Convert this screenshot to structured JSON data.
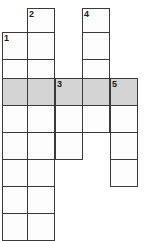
{
  "puzzle": {
    "type": "crossword-grid",
    "columns": 5,
    "rows": 9,
    "cell_size": 27,
    "colors": {
      "cell_fill": "#fdfdfd",
      "shaded_fill": "#d4d4d4",
      "grid_line": "#3a3a3a",
      "number_text": "#1a1a1a",
      "page_background": "#ffffff"
    },
    "clue_numbers": [
      "1",
      "2",
      "3",
      "4",
      "5"
    ],
    "shaded_row_index": 3,
    "cells": [
      {
        "name": "cell-c2-r0",
        "col": 1,
        "row": 0,
        "x": 27,
        "y": 8,
        "w": 28,
        "h": 25,
        "shaded": false,
        "number": "2"
      },
      {
        "name": "cell-c4-r0",
        "col": 3,
        "row": 0,
        "x": 82,
        "y": 8,
        "w": 28,
        "h": 25,
        "shaded": false,
        "number": "4"
      },
      {
        "name": "cell-c1-r1",
        "col": 0,
        "row": 1,
        "x": 2,
        "y": 32,
        "w": 26,
        "h": 28,
        "shaded": false,
        "number": "1"
      },
      {
        "name": "cell-c2-r1",
        "col": 1,
        "row": 1,
        "x": 27,
        "y": 32,
        "w": 28,
        "h": 28,
        "shaded": false,
        "number": ""
      },
      {
        "name": "cell-c4-r1",
        "col": 3,
        "row": 1,
        "x": 82,
        "y": 32,
        "w": 28,
        "h": 28,
        "shaded": false,
        "number": ""
      },
      {
        "name": "cell-c1-r2",
        "col": 0,
        "row": 2,
        "x": 2,
        "y": 59,
        "w": 26,
        "h": 20,
        "shaded": false,
        "number": ""
      },
      {
        "name": "cell-c2-r2",
        "col": 1,
        "row": 2,
        "x": 27,
        "y": 59,
        "w": 28,
        "h": 20,
        "shaded": false,
        "number": ""
      },
      {
        "name": "cell-c4-r2",
        "col": 3,
        "row": 2,
        "x": 82,
        "y": 59,
        "w": 28,
        "h": 20,
        "shaded": false,
        "number": ""
      },
      {
        "name": "cell-c1-r3",
        "col": 0,
        "row": 3,
        "x": 2,
        "y": 78,
        "w": 26,
        "h": 28,
        "shaded": true,
        "number": ""
      },
      {
        "name": "cell-c2-r3",
        "col": 1,
        "row": 3,
        "x": 27,
        "y": 78,
        "w": 28,
        "h": 28,
        "shaded": true,
        "number": ""
      },
      {
        "name": "cell-c3-r3",
        "col": 2,
        "row": 3,
        "x": 55,
        "y": 78,
        "w": 28,
        "h": 28,
        "shaded": true,
        "number": "3"
      },
      {
        "name": "cell-c4-r3",
        "col": 3,
        "row": 3,
        "x": 82,
        "y": 78,
        "w": 28,
        "h": 28,
        "shaded": true,
        "number": ""
      },
      {
        "name": "cell-c5-r3",
        "col": 4,
        "row": 3,
        "x": 110,
        "y": 78,
        "w": 28,
        "h": 28,
        "shaded": true,
        "number": "5"
      },
      {
        "name": "cell-c1-r4",
        "col": 0,
        "row": 4,
        "x": 2,
        "y": 105,
        "w": 26,
        "h": 28,
        "shaded": false,
        "number": ""
      },
      {
        "name": "cell-c2-r4",
        "col": 1,
        "row": 4,
        "x": 27,
        "y": 105,
        "w": 28,
        "h": 28,
        "shaded": false,
        "number": ""
      },
      {
        "name": "cell-c3-r4",
        "col": 2,
        "row": 4,
        "x": 55,
        "y": 105,
        "w": 28,
        "h": 28,
        "shaded": false,
        "number": ""
      },
      {
        "name": "cell-c4-r4",
        "col": 3,
        "row": 4,
        "x": 82,
        "y": 105,
        "w": 28,
        "h": 28,
        "shaded": false,
        "number": ""
      },
      {
        "name": "cell-c5-r4",
        "col": 4,
        "row": 4,
        "x": 110,
        "y": 105,
        "w": 28,
        "h": 28,
        "shaded": false,
        "number": ""
      },
      {
        "name": "cell-c1-r5",
        "col": 0,
        "row": 5,
        "x": 2,
        "y": 132,
        "w": 26,
        "h": 28,
        "shaded": false,
        "number": ""
      },
      {
        "name": "cell-c2-r5",
        "col": 1,
        "row": 5,
        "x": 27,
        "y": 132,
        "w": 28,
        "h": 28,
        "shaded": false,
        "number": ""
      },
      {
        "name": "cell-c3-r5",
        "col": 2,
        "row": 5,
        "x": 55,
        "y": 132,
        "w": 28,
        "h": 28,
        "shaded": false,
        "number": ""
      },
      {
        "name": "cell-c5-r5",
        "col": 4,
        "row": 5,
        "x": 110,
        "y": 132,
        "w": 28,
        "h": 28,
        "shaded": false,
        "number": ""
      },
      {
        "name": "cell-c1-r6",
        "col": 0,
        "row": 6,
        "x": 2,
        "y": 159,
        "w": 26,
        "h": 28,
        "shaded": false,
        "number": ""
      },
      {
        "name": "cell-c2-r6",
        "col": 1,
        "row": 6,
        "x": 27,
        "y": 159,
        "w": 28,
        "h": 28,
        "shaded": false,
        "number": ""
      },
      {
        "name": "cell-c5-r6",
        "col": 4,
        "row": 6,
        "x": 110,
        "y": 159,
        "w": 28,
        "h": 28,
        "shaded": false,
        "number": ""
      },
      {
        "name": "cell-c1-r7",
        "col": 0,
        "row": 7,
        "x": 2,
        "y": 186,
        "w": 26,
        "h": 28,
        "shaded": false,
        "number": ""
      },
      {
        "name": "cell-c2-r7",
        "col": 1,
        "row": 7,
        "x": 27,
        "y": 186,
        "w": 28,
        "h": 28,
        "shaded": false,
        "number": ""
      },
      {
        "name": "cell-c1-r8",
        "col": 0,
        "row": 8,
        "x": 2,
        "y": 213,
        "w": 26,
        "h": 28,
        "shaded": false,
        "number": ""
      },
      {
        "name": "cell-c2-r8",
        "col": 1,
        "row": 8,
        "x": 27,
        "y": 213,
        "w": 28,
        "h": 28,
        "shaded": false,
        "number": ""
      }
    ]
  }
}
